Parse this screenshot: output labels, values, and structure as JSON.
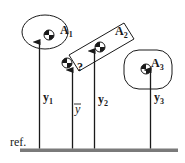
{
  "diagram": {
    "reference_label": "ref.",
    "bodies": [
      {
        "name": "A",
        "sub": "1",
        "shape": "ellipse",
        "height_label": "y",
        "height_sub": "1"
      },
      {
        "name": "A",
        "sub": "2",
        "shape": "rectangle",
        "height_label": "y",
        "height_sub": "2"
      },
      {
        "name": "A",
        "sub": "3",
        "shape": "rounded-rectangle",
        "height_label": "y",
        "height_sub": "3"
      }
    ],
    "combined": {
      "unknown_marker": "?",
      "height_label": "y"
    },
    "colors": {
      "ground": "#7a7a7a",
      "stroke": "#1a1a1a"
    }
  }
}
